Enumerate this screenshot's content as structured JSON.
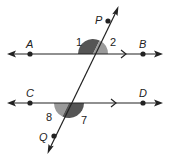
{
  "diagram": {
    "type": "parallel-lines-transversal",
    "colors": {
      "line": "#222222",
      "angle_dark": "#555555",
      "angle_light": "#9a9a9a",
      "background": "#ffffff"
    },
    "lines": [
      {
        "id": "AB",
        "points": [
          "A",
          "B"
        ],
        "parallel_mark": true
      },
      {
        "id": "CD",
        "points": [
          "C",
          "D"
        ],
        "parallel_mark": true
      },
      {
        "id": "PQ",
        "points": [
          "P",
          "Q"
        ],
        "role": "transversal"
      }
    ],
    "point_labels": {
      "A": "A",
      "B": "B",
      "C": "C",
      "D": "D",
      "P": "P",
      "Q": "Q"
    },
    "angle_labels": {
      "a1": "1",
      "a2": "2",
      "a7": "7",
      "a8": "8"
    }
  }
}
